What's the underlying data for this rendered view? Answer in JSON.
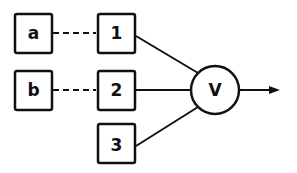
{
  "diagram": {
    "colors": {
      "stroke": "#111111",
      "background": "#ffffff"
    },
    "inputs": [
      {
        "id": "a",
        "label": "a"
      },
      {
        "id": "b",
        "label": "b"
      }
    ],
    "units": [
      {
        "id": "1",
        "label": "1"
      },
      {
        "id": "2",
        "label": "2"
      },
      {
        "id": "3",
        "label": "3"
      }
    ],
    "combiner": {
      "label": "V"
    },
    "edges": [
      {
        "from": "a",
        "to": "1",
        "style": "dashed"
      },
      {
        "from": "b",
        "to": "2",
        "style": "dashed"
      },
      {
        "from": "1",
        "to": "V",
        "style": "solid"
      },
      {
        "from": "2",
        "to": "V",
        "style": "solid"
      },
      {
        "from": "3",
        "to": "V",
        "style": "solid"
      },
      {
        "from": "V",
        "to": "output",
        "style": "arrow"
      }
    ]
  }
}
